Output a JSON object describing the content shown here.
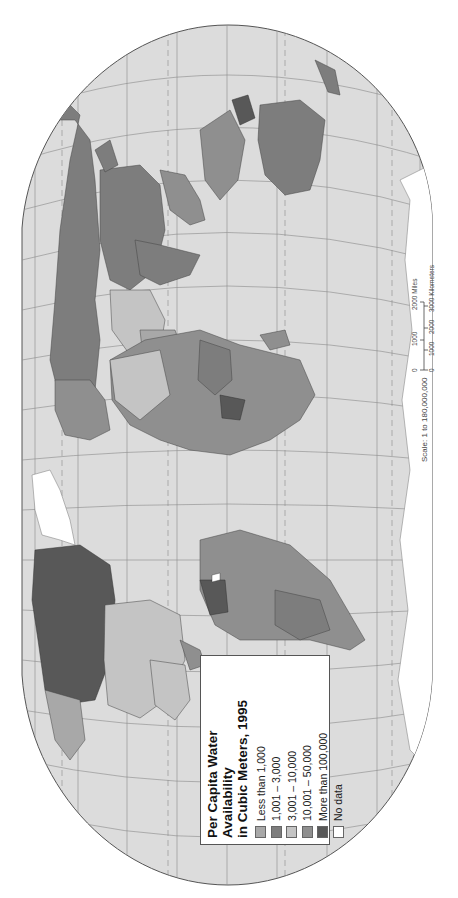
{
  "map": {
    "title_line1": "Per Capita Water Availability",
    "title_line2": "in Cubic Meters, 1995",
    "orientation": "rotated 90° counterclockwise",
    "colors": {
      "ocean": "#dcdcdc",
      "frame_border": "#555555",
      "graticule": "#8a8a8a"
    }
  },
  "legend": {
    "title_line1": "Per Capita Water Availability",
    "title_line2": "in Cubic Meters, 1995",
    "items": [
      {
        "label": "Less than 1,000",
        "color": "#a8a8a8"
      },
      {
        "label": "1,001 – 3,000",
        "color": "#7d7d7d"
      },
      {
        "label": "3,001 – 10,000",
        "color": "#c4c4c4"
      },
      {
        "label": "10,001 – 50,000",
        "color": "#8f8f8f"
      },
      {
        "label": "More than 100,000",
        "color": "#585858"
      },
      {
        "label": "No data",
        "color": "#ffffff"
      }
    ]
  },
  "scale": {
    "text": "Scale: 1 to 180,000,000",
    "miles_ticks": [
      "0",
      "1000",
      "2000 Miles"
    ],
    "km_ticks": [
      "0",
      "1000",
      "2000",
      "3000 Kilometers"
    ]
  }
}
